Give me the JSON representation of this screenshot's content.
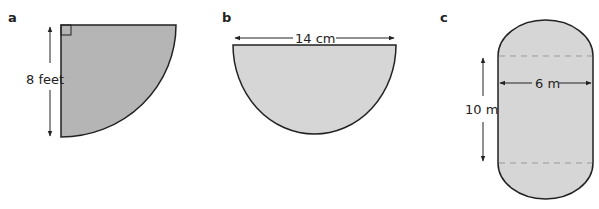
{
  "figures": [
    {
      "part_label": "a",
      "shape": "quarter circle",
      "dimension_label": "8 feet",
      "fill": "#b5b5b5",
      "has_right_angle_marker": true
    },
    {
      "part_label": "b",
      "shape": "semicircle",
      "dimension_label": "14 cm",
      "fill": "#d6d6d6"
    },
    {
      "part_label": "c",
      "shape": "stadium (rectangle with two semicircular ends)",
      "width_label": "6 m",
      "height_label": "10 m",
      "fill": "#d6d6d6"
    }
  ],
  "colors": {
    "stroke": "#222222",
    "dashed": "#999999"
  }
}
